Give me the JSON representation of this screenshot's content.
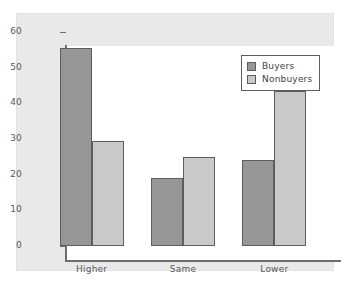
{
  "chart_data": {
    "type": "bar",
    "title": "",
    "subtitle": "",
    "xlabel": "",
    "ylabel": "",
    "categories": [
      "Higher",
      "Same",
      "Lower"
    ],
    "series": [
      {
        "name": "Buyers",
        "color": "#969696",
        "values": [
          55.5,
          19,
          24
        ]
      },
      {
        "name": "Nonbuyers",
        "color": "#c9c9c9",
        "values": [
          29.5,
          25,
          43.5
        ]
      }
    ],
    "ylim": [
      0,
      60
    ],
    "ytick_values": [
      0,
      10,
      20,
      30,
      40,
      50,
      60
    ],
    "ytick_labels": [
      "0",
      "10",
      "20",
      "30",
      "40",
      "50",
      "60"
    ],
    "grid": false,
    "legend": {
      "position": "top-right",
      "entries": [
        "Buyers",
        "Nonbuyers"
      ]
    },
    "annotations": []
  },
  "style": {
    "panel_background": "#e9e9e9",
    "plot_background": "#ffffff",
    "axis_color": "#6e6e6e",
    "bar_edge_color": "#5d5d5d",
    "text_color": "#56585c"
  }
}
